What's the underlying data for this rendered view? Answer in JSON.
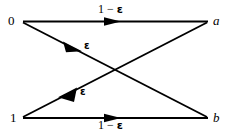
{
  "figure": {
    "kind": "binary-symmetric-channel-diagram",
    "background_color": "#ffffff",
    "stroke_color": "#000000",
    "nodes": {
      "input_top": "0",
      "input_bottom": "1",
      "output_top": "a",
      "output_bottom": "b"
    },
    "edges": {
      "top_horizontal": {
        "from": "0",
        "to": "a",
        "label_prefix": "1 − ",
        "label_symbol": "ε"
      },
      "bottom_horizontal": {
        "from": "1",
        "to": "b",
        "label_prefix": "1 − ",
        "label_symbol": "ε"
      },
      "diagonal_down": {
        "from": "0",
        "to": "b",
        "label_prefix": "",
        "label_symbol": "ε"
      },
      "diagonal_up": {
        "from": "1",
        "to": "a",
        "label_prefix": "",
        "label_symbol": "ε"
      }
    }
  }
}
